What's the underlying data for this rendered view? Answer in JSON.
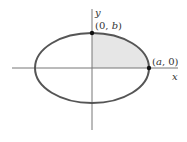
{
  "diagram": {
    "type": "ellipse",
    "colors": {
      "curve": "#555555",
      "axis": "#777777",
      "fill": "#e6e6e6",
      "point": "#111111",
      "text": "#333333"
    },
    "axes": {
      "x_label": "x",
      "y_label": "y"
    },
    "points": [
      {
        "label_open": "(0, ",
        "label_var": "b",
        "label_close": ")"
      },
      {
        "label_open": "(",
        "label_var": "a",
        "label_close": ", 0)"
      }
    ],
    "shaded_region": "first-quadrant"
  }
}
